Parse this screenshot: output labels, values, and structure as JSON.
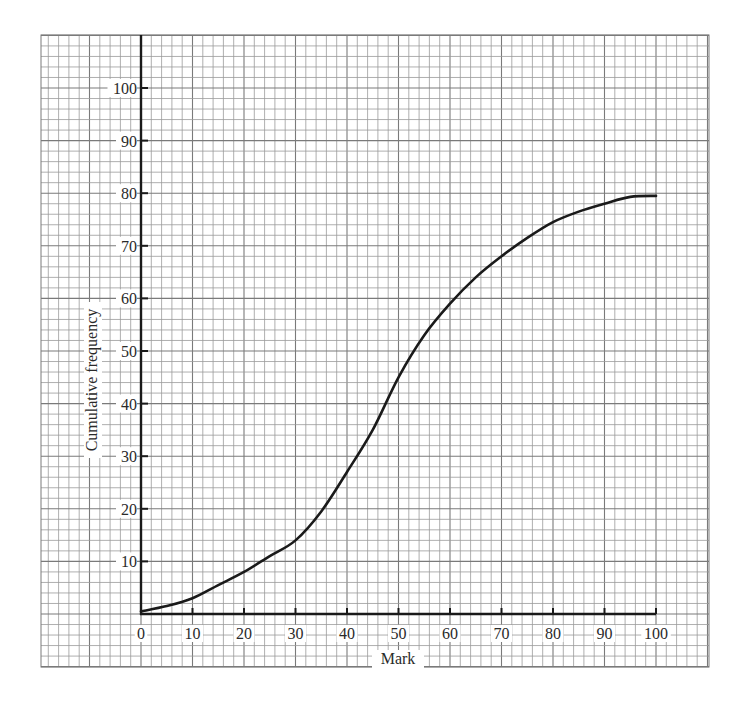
{
  "chart_data": {
    "type": "line",
    "title": "",
    "xlabel": "Mark",
    "ylabel": "Cumulative frequency",
    "xlim": [
      0,
      100
    ],
    "ylim": [
      0,
      100
    ],
    "grid": true,
    "legend": null,
    "x_ticks": [
      0,
      10,
      20,
      30,
      40,
      50,
      60,
      70,
      80,
      90,
      100
    ],
    "y_ticks": [
      10,
      20,
      30,
      40,
      50,
      60,
      70,
      80,
      90,
      100
    ],
    "x_tick_labels": [
      "0",
      "10",
      "20",
      "30",
      "40",
      "50",
      "60",
      "70",
      "80",
      "90",
      "100"
    ],
    "y_tick_labels": [
      "10",
      "20",
      "30",
      "40",
      "50",
      "60",
      "70",
      "80",
      "90",
      "100"
    ],
    "series": [
      {
        "name": "Cumulative frequency",
        "style": "smooth-curve",
        "color": "#1a1a1a",
        "x": [
          0,
          5,
          10,
          15,
          20,
          25,
          30,
          35,
          40,
          45,
          50,
          55,
          60,
          65,
          70,
          75,
          80,
          85,
          90,
          95,
          100
        ],
        "values": [
          0.5,
          1.5,
          3,
          5.5,
          8,
          11,
          14,
          19.5,
          27,
          35,
          45,
          53,
          59,
          64,
          68,
          71.5,
          74.5,
          76.5,
          78,
          79.3,
          79.5
        ]
      }
    ]
  },
  "colors": {
    "background": "#ffffff",
    "grid": "#9a9a9a",
    "grid_major": "#7a7a7a",
    "axis": "#1a1a1a",
    "curve": "#1a1a1a",
    "text": "#2a2a2a"
  }
}
